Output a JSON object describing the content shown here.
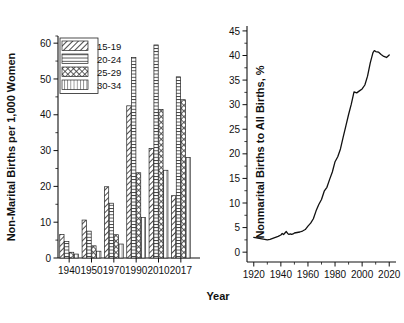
{
  "figure": {
    "shared_xlabel": "Year",
    "background": "#ffffff",
    "line_color": "#111111"
  },
  "chart_data": [
    {
      "type": "bar",
      "id": "nonmarital-birth-rate-by-age",
      "title": "",
      "xlabel": "Year",
      "ylabel": "Non-Marital Births per 1,000 Women",
      "categories": [
        "1940",
        "1950",
        "1970",
        "1990",
        "2010",
        "2017"
      ],
      "ylim": [
        0,
        62
      ],
      "yticks": [
        0,
        10,
        20,
        30,
        40,
        50,
        60
      ],
      "ytick_labels": [
        "0",
        "10",
        "20",
        "30",
        "40",
        "50",
        "60"
      ],
      "grid": false,
      "legend_position": "upper-left-inside",
      "series": [
        {
          "name": "15-19",
          "pattern": "diagonal-hatch",
          "values": [
            6.6,
            10.6,
            19.9,
            42.5,
            30.6,
            17.4
          ]
        },
        {
          "name": "20-24",
          "pattern": "horizontal-lines",
          "values": [
            4.6,
            7.5,
            15.3,
            56.0,
            59.5,
            50.6
          ]
        },
        {
          "name": "25-29",
          "pattern": "crosshatch",
          "values": [
            1.6,
            3.4,
            6.5,
            23.8,
            41.5,
            44.2
          ]
        },
        {
          "name": "30-34",
          "pattern": "vertical-lines",
          "values": [
            1.1,
            1.9,
            3.9,
            11.3,
            24.5,
            28.1
          ]
        }
      ]
    },
    {
      "type": "line",
      "id": "nonmarital-share-of-all-births",
      "title": "",
      "xlabel": "Year",
      "ylabel": "Nonmarital Births to All Births, %",
      "xlim": [
        1915,
        2025
      ],
      "ylim": [
        -2,
        46
      ],
      "xticks": [
        1920,
        1940,
        1960,
        1980,
        2000,
        2020
      ],
      "xtick_labels": [
        "1920",
        "1940",
        "1960",
        "1980",
        "2000",
        "2020"
      ],
      "yticks": [
        0,
        5,
        10,
        15,
        20,
        25,
        30,
        35,
        40,
        45
      ],
      "ytick_labels": [
        "0",
        "5",
        "10",
        "15",
        "20",
        "25",
        "30",
        "35",
        "40",
        "45"
      ],
      "grid": false,
      "legend_position": "none",
      "x": [
        1920,
        1922,
        1924,
        1926,
        1928,
        1930,
        1932,
        1934,
        1936,
        1938,
        1940,
        1941,
        1942,
        1943,
        1944,
        1945,
        1946,
        1947,
        1948,
        1949,
        1950,
        1952,
        1954,
        1956,
        1958,
        1960,
        1962,
        1964,
        1966,
        1968,
        1970,
        1972,
        1974,
        1976,
        1978,
        1980,
        1982,
        1984,
        1986,
        1988,
        1990,
        1992,
        1994,
        1996,
        1998,
        2000,
        2002,
        2004,
        2006,
        2008,
        2009,
        2010,
        2012,
        2014,
        2016,
        2018,
        2020
      ],
      "y": [
        3.0,
        2.9,
        2.8,
        2.7,
        2.6,
        2.5,
        2.6,
        2.8,
        3.0,
        3.2,
        3.5,
        3.8,
        3.6,
        3.9,
        4.2,
        3.8,
        3.6,
        3.7,
        3.6,
        3.7,
        3.9,
        4.0,
        4.1,
        4.3,
        4.6,
        5.3,
        5.9,
        6.8,
        8.4,
        9.7,
        10.7,
        12.4,
        13.2,
        14.8,
        16.3,
        18.4,
        19.4,
        21.0,
        23.4,
        25.7,
        28.0,
        30.1,
        32.6,
        32.4,
        32.8,
        33.2,
        34.0,
        35.8,
        38.5,
        40.6,
        41.0,
        40.8,
        40.7,
        40.2,
        39.8,
        39.6,
        40.1
      ]
    }
  ]
}
